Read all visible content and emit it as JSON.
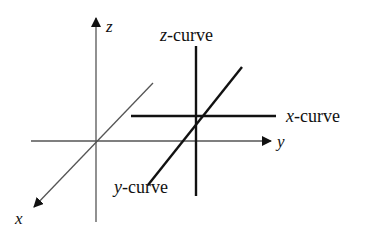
{
  "diagram": {
    "axes": {
      "z": {
        "label": "z"
      },
      "y": {
        "label": "y"
      },
      "x": {
        "label": "x"
      }
    },
    "curves": [
      {
        "id": "z-curve",
        "var": "z",
        "suffix": "-curve"
      },
      {
        "id": "x-curve",
        "var": "x",
        "suffix": "-curve"
      },
      {
        "id": "y-curve",
        "var": "y",
        "suffix": "-curve"
      }
    ],
    "colors": {
      "axis": "#555555",
      "curve": "#111111",
      "background": "#ffffff"
    }
  }
}
